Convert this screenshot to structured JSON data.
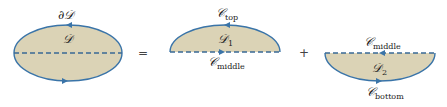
{
  "colors": {
    "fill": "#dbd3b6",
    "stroke": "#3a74a8",
    "dash": "#3a6a95",
    "text": "#222222"
  },
  "region_full": {
    "boundary_label": "∂𝒟",
    "region_label": "𝒟"
  },
  "operators": {
    "equals": "=",
    "plus": "+"
  },
  "region_top": {
    "region_label": "𝒟",
    "region_sub": "1",
    "curve_top_label": "𝒞",
    "curve_top_sub": "top",
    "curve_bottom_label": "𝒞",
    "curve_bottom_sub": "middle"
  },
  "region_bottom": {
    "region_label": "𝒟",
    "region_sub": "2",
    "curve_top_label": "𝒞",
    "curve_top_sub": "middle",
    "curve_bottom_label": "𝒞",
    "curve_bottom_sub": "bottom"
  }
}
